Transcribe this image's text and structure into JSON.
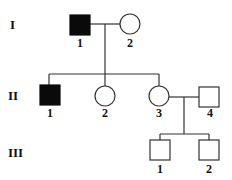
{
  "generations": [
    {
      "label": "I",
      "y": 28
    },
    {
      "label": "II",
      "y": 99
    },
    {
      "label": "III",
      "y": 155
    }
  ],
  "individuals": [
    {
      "id": "I-1",
      "number": "1",
      "sex": "male",
      "affected": true
    },
    {
      "id": "I-2",
      "number": "2",
      "sex": "female",
      "affected": false
    },
    {
      "id": "II-1",
      "number": "1",
      "sex": "male",
      "affected": true
    },
    {
      "id": "II-2",
      "number": "2",
      "sex": "female",
      "affected": false
    },
    {
      "id": "II-3",
      "number": "3",
      "sex": "female",
      "affected": false
    },
    {
      "id": "II-4",
      "number": "4",
      "sex": "male",
      "affected": false
    },
    {
      "id": "III-1",
      "number": "1",
      "sex": "male",
      "affected": false
    },
    {
      "id": "III-2",
      "number": "2",
      "sex": "male",
      "affected": false
    }
  ],
  "relationships": [
    {
      "type": "mating",
      "partners": [
        "I-1",
        "I-2"
      ],
      "children": [
        "II-1",
        "II-2",
        "II-3"
      ]
    },
    {
      "type": "mating",
      "partners": [
        "II-3",
        "II-4"
      ],
      "children": [
        "III-1",
        "III-2"
      ]
    }
  ],
  "colors": {
    "affected": "#0a0a0a",
    "unaffected": "#ffffff",
    "line": "#333333"
  }
}
